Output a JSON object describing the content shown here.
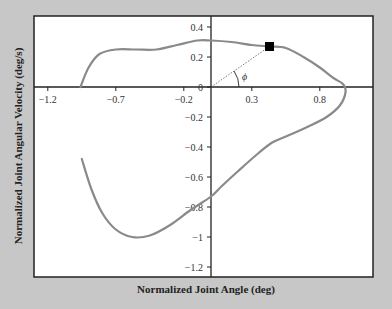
{
  "chart_data": {
    "type": "line",
    "title": "",
    "xlabel": "Normalized Joint Angle (deg)",
    "ylabel": "Normalized Joint Angular Velocity (deg/s)",
    "xlim": [
      -1.3,
      1.19
    ],
    "ylim": [
      -1.27,
      0.47
    ],
    "xticks": [
      -1.2,
      -0.7,
      -0.2,
      0.3,
      0.8
    ],
    "xtick_labels": [
      "-1.2",
      "-0.7",
      "-0.2",
      "0.3",
      "0.8"
    ],
    "yticks": [
      0.4,
      0.2,
      0,
      -0.2,
      -0.4,
      -0.6,
      -0.8,
      -1,
      -1.2
    ],
    "ytick_labels": [
      "0.4",
      "0.2",
      "0",
      "-0.2",
      "-0.4",
      "-0.6",
      "-0.8",
      "-1",
      "-1.2"
    ],
    "grid": false,
    "legend": null,
    "series": [
      {
        "name": "phase portrait",
        "color": "#8a8a8a",
        "x": [
          -0.96,
          -0.9,
          -0.82,
          -0.7,
          -0.55,
          -0.4,
          -0.25,
          -0.1,
          0.0,
          0.15,
          0.3,
          0.43,
          0.55,
          0.68,
          0.8,
          0.9,
          0.97,
          0.99,
          0.95,
          0.85,
          0.7,
          0.55,
          0.45,
          0.35,
          0.2,
          0.08,
          0.0,
          -0.15,
          -0.3,
          -0.45,
          -0.58,
          -0.7,
          -0.8,
          -0.88,
          -0.95
        ],
        "y": [
          0.0,
          0.13,
          0.22,
          0.25,
          0.25,
          0.25,
          0.28,
          0.31,
          0.31,
          0.3,
          0.28,
          0.27,
          0.26,
          0.2,
          0.13,
          0.06,
          0.02,
          -0.03,
          -0.12,
          -0.2,
          -0.27,
          -0.33,
          -0.37,
          -0.44,
          -0.56,
          -0.66,
          -0.73,
          -0.82,
          -0.92,
          -0.99,
          -1.0,
          -0.95,
          -0.84,
          -0.68,
          -0.48
        ]
      }
    ],
    "annotations": [
      {
        "type": "marker",
        "shape": "square",
        "x": 0.43,
        "y": 0.27,
        "color": "#000000"
      },
      {
        "type": "dotted-line",
        "from": [
          0,
          0
        ],
        "to": [
          0.43,
          0.27
        ]
      },
      {
        "type": "angle-arc",
        "label": "ϕ"
      }
    ]
  },
  "colors": {
    "background": "#c7c7c7",
    "plot_bg": "#ffffff",
    "curve": "#8a8a8a",
    "axis": "#222222"
  }
}
